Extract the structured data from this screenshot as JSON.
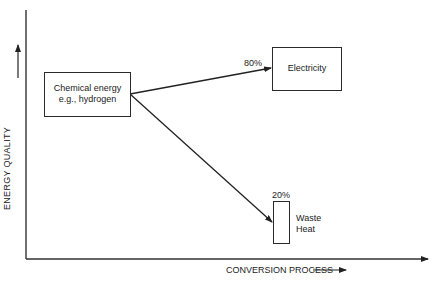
{
  "diagram": {
    "axes": {
      "y_label": "ENERGY QUALITY",
      "x_label": "CONVERSION PROCESS"
    },
    "nodes": {
      "source": {
        "line1": "Chemical energy",
        "line2": "e.g., hydrogen"
      },
      "electricity": {
        "label": "Electricity"
      },
      "waste": {
        "line1": "Waste",
        "line2": "Heat"
      }
    },
    "edges": {
      "to_electricity": {
        "percent": "80%"
      },
      "to_waste": {
        "percent": "20%"
      }
    }
  }
}
